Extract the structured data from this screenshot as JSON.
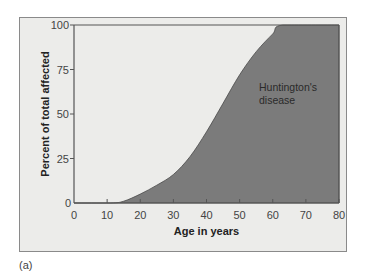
{
  "chart_data": {
    "type": "area",
    "title": "",
    "xlabel": "Age in years",
    "ylabel": "Percent of total affected",
    "xlim": [
      0,
      80
    ],
    "ylim": [
      0,
      100
    ],
    "x_ticks": [
      0,
      10,
      20,
      30,
      40,
      50,
      60,
      70,
      80
    ],
    "y_ticks": [
      0,
      25,
      50,
      75,
      100
    ],
    "grid": false,
    "series": [
      {
        "name": "Huntington's disease",
        "x": [
          0,
          11,
          15,
          20,
          25,
          30,
          35,
          40,
          45,
          50,
          55,
          60,
          63,
          80
        ],
        "values": [
          0,
          0,
          1,
          5,
          10,
          16,
          26,
          40,
          56,
          72,
          85,
          95,
          100,
          100
        ],
        "fill": "#7b7b7b"
      }
    ],
    "annotations": [
      {
        "text_lines": [
          "Huntington's",
          "disease"
        ],
        "x": 56,
        "y": 65
      }
    ]
  },
  "labels": {
    "y_axis_title": "Percent of total affected",
    "x_axis_title": "Age in years",
    "area_label_line1": "Huntington's",
    "area_label_line2": "disease",
    "panel_caption": "(a)"
  },
  "ticks": {
    "x": [
      "0",
      "10",
      "20",
      "30",
      "40",
      "50",
      "60",
      "70",
      "80"
    ],
    "y": [
      "0",
      "25",
      "50",
      "75",
      "100"
    ]
  },
  "colors": {
    "panel_bg": "#ececea",
    "area_fill": "#7b7b7b",
    "axis": "#555555"
  }
}
